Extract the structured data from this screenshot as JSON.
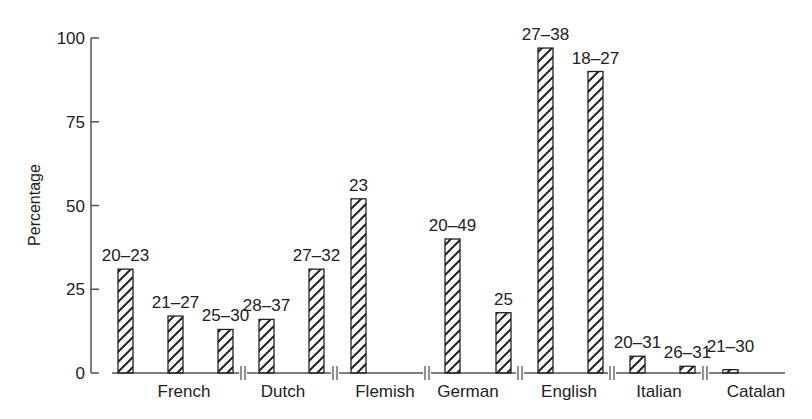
{
  "chart_data": {
    "type": "bar",
    "title": "",
    "xlabel": "",
    "ylabel": "Percentage",
    "ylim": [
      0,
      100
    ],
    "yticks": [
      0,
      25,
      50,
      75,
      100
    ],
    "grid": false,
    "legend": null,
    "pattern": "diagonal-hatch",
    "groups": [
      {
        "name": "French",
        "bars": [
          {
            "label": "20–23",
            "value": 31
          },
          {
            "label": "21–27",
            "value": 17
          },
          {
            "label": "25–30",
            "value": 13
          }
        ]
      },
      {
        "name": "Dutch",
        "bars": [
          {
            "label": "28–37",
            "value": 16
          },
          {
            "label": "27–32",
            "value": 31
          }
        ]
      },
      {
        "name": "Flemish",
        "bars": [
          {
            "label": "23",
            "value": 52
          }
        ]
      },
      {
        "name": "German",
        "bars": [
          {
            "label": "20–49",
            "value": 40
          },
          {
            "label": "25",
            "value": 18
          }
        ]
      },
      {
        "name": "English",
        "bars": [
          {
            "label": "27–38",
            "value": 97
          },
          {
            "label": "18–27",
            "value": 90
          }
        ]
      },
      {
        "name": "Italian",
        "bars": [
          {
            "label": "20–31",
            "value": 5
          },
          {
            "label": "26–31",
            "value": 2
          }
        ]
      },
      {
        "name": "Catalan",
        "bars": [
          {
            "label": "21–30",
            "value": 1
          }
        ]
      }
    ]
  },
  "layout": {
    "bar_x": [
      [
        118,
        168,
        218
      ],
      [
        259,
        309
      ],
      [
        351
      ],
      [
        445,
        496
      ],
      [
        538,
        588
      ],
      [
        630,
        680
      ],
      [
        723
      ]
    ],
    "cat_x": [
      184,
      283,
      385,
      468,
      569,
      659,
      756
    ],
    "label_dy": [
      0,
      0,
      0,
      0,
      0,
      0,
      0,
      0,
      0,
      0,
      0,
      0,
      -10,
      0
    ],
    "break_x": [
      243,
      335,
      427,
      520,
      612,
      705
    ],
    "colors": {
      "axis": "#555555",
      "bar_stroke": "#222222",
      "hatch": "#222222",
      "text": "#222222"
    }
  }
}
